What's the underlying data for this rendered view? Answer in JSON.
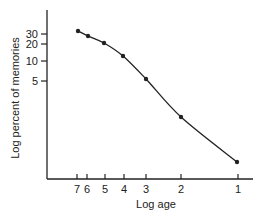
{
  "chart_data": {
    "type": "line",
    "title": "",
    "xlabel": "Log age",
    "ylabel": "Log percent of memories",
    "x_ticks": [
      "7",
      "6",
      "5",
      "4",
      "3",
      "2",
      "1"
    ],
    "y_ticks": [
      "30",
      "20",
      "10",
      "5"
    ],
    "x_scale": "log (reversed)",
    "y_scale": "log",
    "grid": false,
    "legend": null,
    "series": [
      {
        "name": "memories",
        "x": [
          7,
          6,
          5,
          4,
          3,
          2,
          1
        ],
        "values": [
          34,
          28,
          22,
          13,
          5.5,
          1.3,
          0.23
        ]
      }
    ]
  },
  "layout": {
    "x_tick_px": [
      77,
      87,
      105,
      124,
      146,
      181,
      238
    ],
    "y_tick_px": [
      34,
      44,
      61,
      81
    ],
    "point_px": [
      [
        78,
        31
      ],
      [
        88,
        36
      ],
      [
        104,
        43
      ],
      [
        123,
        56
      ],
      [
        146,
        79
      ],
      [
        181,
        117
      ],
      [
        237,
        162
      ]
    ],
    "line_color": "#222222"
  }
}
